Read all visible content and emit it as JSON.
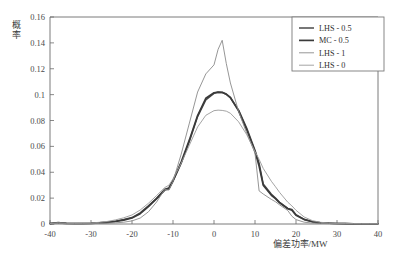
{
  "chart_data": {
    "type": "line",
    "title": "",
    "xlabel": "偏差功率/MW",
    "ylabel": "概率",
    "xlim": [
      -40,
      40
    ],
    "ylim": [
      0,
      0.16
    ],
    "xticks": [
      "-40",
      "-30",
      "-20",
      "-10",
      "0",
      "10",
      "20",
      "30",
      "40"
    ],
    "xtick_values": [
      -40,
      -30,
      -20,
      -10,
      0,
      10,
      20,
      30,
      40
    ],
    "yticks": [
      "0",
      "0.02",
      "0.04",
      "0.06",
      "0.08",
      "0.1",
      "0.12",
      "0.14",
      "0.16"
    ],
    "ytick_values": [
      0,
      0.02,
      0.04,
      0.06,
      0.08,
      0.1,
      0.12,
      0.14,
      0.16
    ],
    "grid": false,
    "legend_position": "top-right",
    "x": [
      -40,
      -38,
      -36,
      -34,
      -32,
      -30,
      -28,
      -26,
      -24,
      -22,
      -20,
      -18,
      -16,
      -14,
      -12,
      -11,
      -10,
      -8,
      -6,
      -4,
      -2,
      0,
      1,
      2,
      3,
      4,
      6,
      8,
      10,
      11,
      12,
      14,
      15,
      16,
      18,
      19,
      20,
      22,
      24,
      26,
      28,
      30,
      32,
      34,
      36,
      38,
      40
    ],
    "series": [
      {
        "name": "LHS - 0.5",
        "color": "#4a4a4a",
        "width": 1.5,
        "values": [
          0.0004,
          0.0012,
          0.0006,
          0.0004,
          0.0004,
          0.0006,
          0.001,
          0.0014,
          0.0022,
          0.0034,
          0.005,
          0.0086,
          0.014,
          0.0198,
          0.0262,
          0.027,
          0.033,
          0.047,
          0.064,
          0.083,
          0.096,
          0.101,
          0.1018,
          0.1016,
          0.1002,
          0.0976,
          0.088,
          0.074,
          0.057,
          0.047,
          0.031,
          0.023,
          0.02,
          0.0168,
          0.012,
          0.0112,
          0.0072,
          0.0036,
          0.0018,
          0.001,
          0.0006,
          0.0004,
          0.0003,
          0.0002,
          0.0002,
          0.0002,
          0.0002
        ]
      },
      {
        "name": "MC - 0.5",
        "color": "#3a3a3a",
        "width": 1.7,
        "values": [
          0.0003,
          0.0008,
          0.0005,
          0.0004,
          0.0004,
          0.0005,
          0.0009,
          0.0013,
          0.002,
          0.003,
          0.0046,
          0.008,
          0.0134,
          0.0196,
          0.0268,
          0.0278,
          0.0336,
          0.0478,
          0.065,
          0.0838,
          0.0972,
          0.1014,
          0.102,
          0.1018,
          0.1004,
          0.0978,
          0.0874,
          0.0728,
          0.056,
          0.0448,
          0.03,
          0.0222,
          0.0196,
          0.0164,
          0.0118,
          0.0106,
          0.0068,
          0.0034,
          0.0017,
          0.0009,
          0.0006,
          0.0004,
          0.0003,
          0.0002,
          0.0002,
          0.0002,
          0.0002
        ]
      },
      {
        "name": "LHS - 1",
        "color": "#8a8a8a",
        "width": 0.9,
        "values": [
          0.0002,
          0.0004,
          0.0002,
          0.0002,
          0.0002,
          0.0003,
          0.0004,
          0.0006,
          0.0009,
          0.0014,
          0.0024,
          0.0046,
          0.0094,
          0.017,
          0.0268,
          0.0262,
          0.033,
          0.054,
          0.078,
          0.102,
          0.116,
          0.123,
          0.135,
          0.142,
          0.124,
          0.109,
          0.087,
          0.07,
          0.0548,
          0.0256,
          0.0232,
          0.019,
          0.0172,
          0.0148,
          0.0104,
          0.006,
          0.0034,
          0.0014,
          0.0007,
          0.0004,
          0.0003,
          0.0002,
          0.0002,
          0.0002,
          0.0002,
          0.0002,
          0.0002
        ]
      },
      {
        "name": "LHS - 0",
        "color": "#9a9a9a",
        "width": 0.9,
        "values": [
          0.0004,
          0.001,
          0.0006,
          0.0005,
          0.0006,
          0.0008,
          0.0013,
          0.002,
          0.0032,
          0.0048,
          0.007,
          0.0108,
          0.016,
          0.022,
          0.0282,
          0.03,
          0.0348,
          0.047,
          0.061,
          0.075,
          0.084,
          0.0876,
          0.088,
          0.0878,
          0.0872,
          0.0856,
          0.079,
          0.069,
          0.056,
          0.05,
          0.043,
          0.033,
          0.0288,
          0.0244,
          0.0168,
          0.014,
          0.0106,
          0.0054,
          0.0026,
          0.0013,
          0.0008,
          0.0005,
          0.0004,
          0.0003,
          0.0002,
          0.0002,
          0.0002
        ]
      }
    ]
  },
  "legend": {
    "items": [
      {
        "label": "LHS - 0.5"
      },
      {
        "label": "MC - 0.5"
      },
      {
        "label": "LHS - 1"
      },
      {
        "label": "LHS - 0"
      }
    ]
  },
  "axes": {
    "x_title": "偏差功率/MW",
    "y_title": "概率"
  }
}
